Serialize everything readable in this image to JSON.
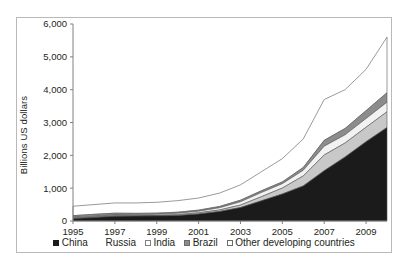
{
  "chart_data": {
    "type": "area",
    "title": "",
    "xlabel": "",
    "ylabel": "Billions US dollars",
    "xlim": [
      1995,
      2010
    ],
    "ylim": [
      0,
      6000
    ],
    "grid": false,
    "legend_position": "bottom",
    "stacked": true,
    "x": [
      1995,
      1996,
      1997,
      1998,
      1999,
      2000,
      2001,
      2002,
      2003,
      2004,
      2005,
      2006,
      2007,
      2008,
      2009,
      2010
    ],
    "xticks": [
      "1995",
      "1997",
      "1999",
      "2001",
      "2003",
      "2005",
      "2007",
      "2009"
    ],
    "xtick_values": [
      1995,
      1997,
      1999,
      2001,
      2003,
      2005,
      2007,
      2009
    ],
    "yticks": [
      "0",
      "1,000",
      "2,000",
      "3,000",
      "4,000",
      "5,000",
      "6,000"
    ],
    "ytick_values": [
      0,
      1000,
      2000,
      3000,
      4000,
      5000,
      6000
    ],
    "series": [
      {
        "name": "China",
        "color": "#1b1b1b",
        "swatch": "#1b1b1b",
        "swatch_border": "#1b1b1b",
        "values": [
          75,
          107,
          143,
          150,
          158,
          168,
          216,
          292,
          408,
          615,
          822,
          1069,
          1531,
          1950,
          2416,
          2847
        ]
      },
      {
        "name": "Russia",
        "color": "#c8c8c8",
        "swatch": "#ffffff",
        "swatch_border": "#ffffff",
        "values": [
          17,
          15,
          18,
          12,
          13,
          28,
          33,
          44,
          77,
          125,
          182,
          304,
          479,
          427,
          439,
          479
        ]
      },
      {
        "name": "India",
        "color": "#f2f2f2",
        "swatch": "#ffffff",
        "swatch_border": "#808080",
        "values": [
          20,
          21,
          25,
          27,
          32,
          38,
          46,
          68,
          99,
          127,
          132,
          171,
          267,
          248,
          266,
          292
        ]
      },
      {
        "name": "Brazil",
        "color": "#8c8c8c",
        "swatch": "#8c8c8c",
        "swatch_border": "#6b6b6b",
        "values": [
          51,
          60,
          52,
          44,
          36,
          33,
          36,
          38,
          49,
          53,
          54,
          86,
          180,
          194,
          239,
          289
        ]
      },
      {
        "name": "Other developing countries",
        "color": "#ffffff",
        "swatch": "#ffffff",
        "swatch_border": "#6b6b6b",
        "values": [
          287,
          297,
          312,
          317,
          331,
          353,
          369,
          408,
          467,
          580,
          710,
          870,
          1243,
          1181,
          1260,
          1693
        ]
      }
    ]
  }
}
